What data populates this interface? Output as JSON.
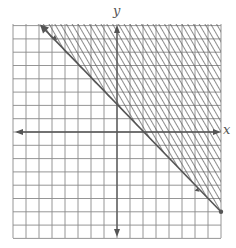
{
  "chart_data": {
    "type": "inequality-graph",
    "title": "",
    "xlabel": "x",
    "ylabel": "y",
    "xlim": [
      -8,
      8
    ],
    "ylim": [
      -8,
      8
    ],
    "grid": true,
    "grid_step": 1,
    "boundary_line": {
      "equation": "y = -x + 2",
      "slope": -1,
      "intercept": 2,
      "style": "solid",
      "points": [
        [
          -6,
          8
        ],
        [
          8,
          -6
        ]
      ]
    },
    "shaded_region": "above",
    "inequality": "y >= -x + 2",
    "shading_style": "diagonal-hatch"
  },
  "labels": {
    "x": "x",
    "y": "y"
  },
  "colors": {
    "grid": "#8a8a8a",
    "axis": "#555555",
    "line": "#555555",
    "hatch": "#555555",
    "background": "#ffffff"
  }
}
